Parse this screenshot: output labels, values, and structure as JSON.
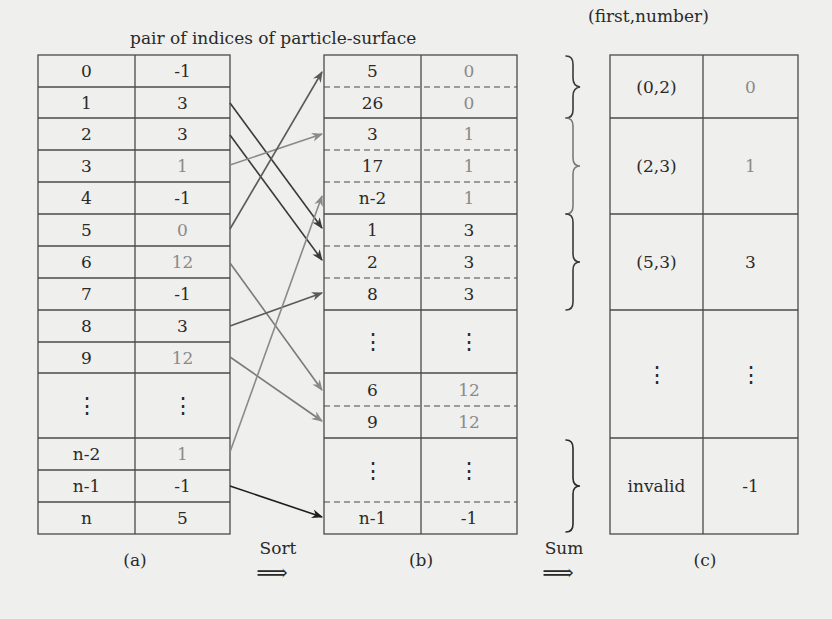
{
  "title": "pair of indices of particle-surface",
  "title_c": "(first,number)",
  "labels": {
    "a": "(a)",
    "b": "(b)",
    "c": "(c)",
    "sort": "Sort",
    "sum": "Sum",
    "implies": "⟹",
    "vdots": "⋮"
  },
  "colors": {
    "dark": "#2a2a2a",
    "gray": "#8a8a8a",
    "line": "#4a4a4a",
    "bg": "#efefed"
  },
  "table_a": {
    "rows": [
      {
        "particle": "0",
        "surface": "-1",
        "gray": false
      },
      {
        "particle": "1",
        "surface": "3",
        "gray": false
      },
      {
        "particle": "2",
        "surface": "3",
        "gray": false
      },
      {
        "particle": "3",
        "surface": "1",
        "gray": true
      },
      {
        "particle": "4",
        "surface": "-1",
        "gray": false
      },
      {
        "particle": "5",
        "surface": "0",
        "gray": true
      },
      {
        "particle": "6",
        "surface": "12",
        "gray": true
      },
      {
        "particle": "7",
        "surface": "-1",
        "gray": false
      },
      {
        "particle": "8",
        "surface": "3",
        "gray": false
      },
      {
        "particle": "9",
        "surface": "12",
        "gray": true
      },
      {
        "particle": "⋮",
        "surface": "⋮",
        "gray": false
      },
      {
        "particle": "n-2",
        "surface": "1",
        "gray": true
      },
      {
        "particle": "n-1",
        "surface": "-1",
        "gray": false
      },
      {
        "particle": "n",
        "surface": "5",
        "gray": false
      }
    ]
  },
  "table_b": {
    "rows": [
      {
        "particle": "5",
        "surface": "0",
        "gray": true
      },
      {
        "particle": "26",
        "surface": "0",
        "gray": true
      },
      {
        "particle": "3",
        "surface": "1",
        "gray": true
      },
      {
        "particle": "17",
        "surface": "1",
        "gray": true
      },
      {
        "particle": "n-2",
        "surface": "1",
        "gray": true
      },
      {
        "particle": "1",
        "surface": "3",
        "gray": false
      },
      {
        "particle": "2",
        "surface": "3",
        "gray": false
      },
      {
        "particle": "8",
        "surface": "3",
        "gray": false
      },
      {
        "particle": "⋮",
        "surface": "⋮",
        "gray": false
      },
      {
        "particle": "6",
        "surface": "12",
        "gray": true
      },
      {
        "particle": "9",
        "surface": "12",
        "gray": true
      },
      {
        "particle": "⋮",
        "surface": "⋮",
        "gray": false
      },
      {
        "particle": "n-1",
        "surface": "-1",
        "gray": false
      }
    ]
  },
  "table_c": {
    "rows": [
      {
        "pair": "(0,2)",
        "surface": "0",
        "gray": true
      },
      {
        "pair": "(2,3)",
        "surface": "1",
        "gray": true
      },
      {
        "pair": "(5,3)",
        "surface": "3",
        "gray": false
      },
      {
        "pair": "⋮",
        "surface": "⋮",
        "gray": false
      },
      {
        "pair": "invalid",
        "surface": "-1",
        "gray": false
      }
    ]
  }
}
